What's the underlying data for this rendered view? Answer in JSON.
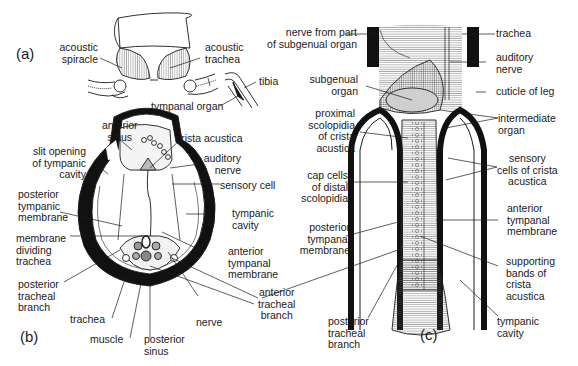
{
  "figure": {
    "panels": [
      {
        "id": "a",
        "label": "(a)"
      },
      {
        "id": "b",
        "label": "(b)"
      },
      {
        "id": "c",
        "label": "(c)"
      }
    ]
  },
  "panel_a": {
    "labels": {
      "acoustic_spiracle": "acoustic\nspiracle",
      "acoustic_trachea": "acoustic\ntrachea",
      "tibia": "tibia",
      "tympanal_organ": "tympanal organ"
    }
  },
  "panel_b": {
    "labels": {
      "anterior_sinus": "anterior\nsinus",
      "crista_acustica": "crista acustica",
      "slit_opening": "slit opening\nof tympanic\ncavity",
      "auditory_nerve": "auditory\nnerve",
      "sensory_cell": "sensory cell",
      "posterior_tympanic_membrane": "posterior\ntympanic\nmembrane",
      "tympanic_cavity": "tympanic\ncavity",
      "membrane_dividing_trachea": "membrane\ndividing\ntrachea",
      "anterior_tympanal_membrane": "anterior\ntympanal\nmembrane",
      "posterior_tracheal_branch": "posterior\ntracheal\nbranch",
      "anterior_tracheal_branch": "anterior\ntracheal\nbranch",
      "trachea": "trachea",
      "nerve": "nerve",
      "muscle": "muscle",
      "posterior_sinus": "posterior\nsinus"
    }
  },
  "panel_c": {
    "labels": {
      "nerve_from_part": "nerve from part\nof subgenual organ",
      "trachea": "trachea",
      "auditory_nerve": "auditory\nnerve",
      "subgenual_organ": "subgenual\norgan",
      "cuticle_of_leg": "cuticle of leg",
      "proximal_scolopidia": "proximal\nscolopidia\nof crista\nacustica",
      "intermediate_organ": "intermediate\norgan",
      "sensory_cells": "sensory\ncells of crista\nacustica",
      "cap_cells": "cap cells\nof distal\nscolopidia",
      "anterior_tympanal_membrane": "anterior\ntympanal\nmembrane",
      "posterior_tympanal_membrane": "posterior\ntympanal\nmembrane",
      "supporting_bands": "supporting\nbands of\ncrista\nacustica",
      "posterior_tracheal_branch": "posterior\ntracheal\nbranch",
      "tympanic_cavity": "tympanic\ncavity"
    }
  },
  "colors": {
    "ink": "#1a1a1a",
    "cuticle": "#111111",
    "light_fill": "#f2f2f2",
    "grey_fill": "#bdbdbd"
  }
}
